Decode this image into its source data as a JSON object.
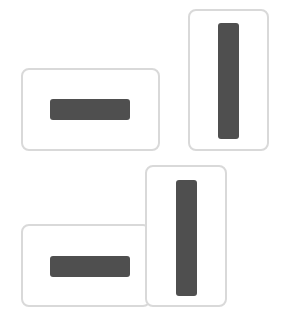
{
  "diagram": {
    "colors": {
      "card_border": "#d9d9d9",
      "card_background": "#ffffff",
      "bar": "#4f4f4f"
    },
    "groups": [
      {
        "name": "separated",
        "cards": [
          {
            "orientation": "landscape",
            "bar": "horizontal"
          },
          {
            "orientation": "portrait",
            "bar": "vertical"
          }
        ]
      },
      {
        "name": "adjacent",
        "cards": [
          {
            "orientation": "landscape",
            "bar": "horizontal"
          },
          {
            "orientation": "portrait",
            "bar": "vertical"
          }
        ]
      }
    ]
  }
}
